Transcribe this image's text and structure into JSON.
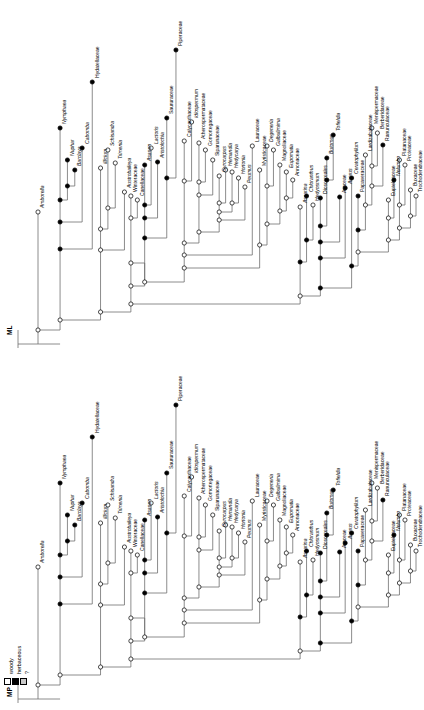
{
  "figure": {
    "kind": "phylogenetic-tree-pair",
    "orientation": "rotated-90",
    "background": "#ffffff",
    "branch_color": "#6f6f6f",
    "node_open_fill": "#ffffff",
    "node_filled_fill": "#000000",
    "node_unknown_fill": "#c9c9c9"
  },
  "legend": {
    "title": "",
    "items": [
      {
        "label": "woody",
        "swatch": "white",
        "color": "#ffffff"
      },
      {
        "label": "herbaceous",
        "swatch": "black",
        "color": "#000000"
      },
      {
        "label": "?",
        "swatch": "gray",
        "color": "#c9c9c9"
      }
    ]
  },
  "trees": [
    {
      "id": "ML",
      "name": "ML",
      "taxa": [
        "Amborella",
        "Nymphaea",
        "Nuphar",
        "Barclaya",
        "Cabomba",
        "Hydatellaceae",
        "Illicium",
        "Schisandra",
        "Trimenia",
        "Austrobaileya",
        "Winteraceae",
        "Canellaceae",
        "Asarum",
        "Lactoris",
        "Aristolochia",
        "Saururaceae",
        "Piperaceae",
        "Calycanthaceae",
        "Idiospermum",
        "Atherospermataceae",
        "Gomortegaceae",
        "Siparunaceae",
        "Gyrocarpus",
        "Hernandia",
        "Hedycarya",
        "Hortonia",
        "Peumus",
        "Lauraceae",
        "Myristicaceae",
        "Degeneria",
        "Galbulimima",
        "Magnoliaceae",
        "Eupomatia",
        "Annonaceae",
        "Ascarina",
        "Chloranthus",
        "Hedyosmum",
        "Dioscoreales",
        "Butomus",
        "Tofieldia",
        "Araceae",
        "Acorus",
        "Ceratophyllum",
        "Papaveraceae",
        "Lardizabalaceae",
        "Menispermaceae",
        "Berberidaceae",
        "Ranunculaceae",
        "Eupteleaceae",
        "Nelumbo",
        "Platanaceae",
        "Proteaceae",
        "Buxaceae",
        "Trochodendraceae"
      ]
    },
    {
      "id": "MP",
      "name": "MP",
      "taxa": [
        "Amborella",
        "Nymphaea",
        "Nuphar",
        "Barclaya",
        "Cabomba",
        "Hydatellaceae",
        "Illicium",
        "Schisandra",
        "Trimenia",
        "Austrobaileya",
        "Winteraceae",
        "Canellaceae",
        "Asarum",
        "Lactoris",
        "Aristolochia",
        "Saururaceae",
        "Piperaceae",
        "Calycanthaceae",
        "Idiospermum",
        "Atherospermataceae",
        "Gomortegaceae",
        "Siparunaceae",
        "Gyrocarpus",
        "Hernandia",
        "Hedycarya",
        "Hortonia",
        "Peumus",
        "Lauraceae",
        "Myristicaceae",
        "Degeneria",
        "Galbulimima",
        "Magnoliaceae",
        "Eupomatia",
        "Annonaceae",
        "Ascarina",
        "Chloranthus",
        "Hedyosmum",
        "Dioscoreales",
        "Butomus",
        "Tofieldia",
        "Araceae",
        "Acorus",
        "Ceratophyllum",
        "Papaveraceae",
        "Lardizabalaceae",
        "Menispermaceae",
        "Berberidaceae",
        "Ranunculaceae",
        "Eupteleaceae",
        "Nelumbo",
        "Platanaceae",
        "Proteaceae",
        "Buxaceae",
        "Trochodendraceae"
      ]
    }
  ],
  "italic_taxa": [
    "Amborella",
    "Nymphaea",
    "Nuphar",
    "Barclaya",
    "Cabomba",
    "Illicium",
    "Schisandra",
    "Trimenia",
    "Austrobaileya",
    "Asarum",
    "Lactoris",
    "Aristolochia",
    "Idiospermum",
    "Gyrocarpus",
    "Hernandia",
    "Hedycarya",
    "Hortonia",
    "Peumus",
    "Degeneria",
    "Galbulimima",
    "Eupomatia",
    "Ascarina",
    "Chloranthus",
    "Hedyosmum",
    "Butomus",
    "Tofieldia",
    "Acorus",
    "Ceratophyllum",
    "Nelumbo"
  ],
  "tip_states": {
    "Amborella": "woody",
    "Nymphaea": "herbaceous",
    "Nuphar": "herbaceous",
    "Barclaya": "herbaceous",
    "Cabomba": "herbaceous",
    "Hydatellaceae": "herbaceous",
    "Illicium": "woody",
    "Schisandra": "woody",
    "Trimenia": "woody",
    "Austrobaileya": "woody",
    "Winteraceae": "woody",
    "Canellaceae": "woody",
    "Asarum": "herbaceous",
    "Lactoris": "woody",
    "Aristolochia": "herbaceous",
    "Saururaceae": "herbaceous",
    "Piperaceae": "herbaceous",
    "Calycanthaceae": "woody",
    "Idiospermum": "woody",
    "Atherospermataceae": "woody",
    "Gomortegaceae": "woody",
    "Siparunaceae": "woody",
    "Gyrocarpus": "woody",
    "Hernandia": "woody",
    "Hedycarya": "woody",
    "Hortonia": "woody",
    "Peumus": "woody",
    "Lauraceae": "woody",
    "Myristicaceae": "woody",
    "Degeneria": "woody",
    "Galbulimima": "woody",
    "Magnoliaceae": "woody",
    "Eupomatia": "woody",
    "Annonaceae": "woody",
    "Ascarina": "woody",
    "Chloranthus": "herbaceous",
    "Hedyosmum": "woody",
    "Dioscoreales": "herbaceous",
    "Butomus": "herbaceous",
    "Tofieldia": "herbaceous",
    "Araceae": "herbaceous",
    "Acorus": "herbaceous",
    "Ceratophyllum": "herbaceous",
    "Papaveraceae": "herbaceous",
    "Lardizabalaceae": "woody",
    "Menispermaceae": "woody",
    "Berberidaceae": "woody",
    "Ranunculaceae": "herbaceous",
    "Eupteleaceae": "woody",
    "Nelumbo": "herbaceous",
    "Platanaceae": "woody",
    "Proteaceae": "woody",
    "Buxaceae": "woody",
    "Trochodendraceae": "woody"
  },
  "chart_data": {
    "type": "tree",
    "title": "",
    "panels": [
      {
        "name": "ML",
        "note": "maximum likelihood reconstruction"
      },
      {
        "name": "MP",
        "note": "maximum parsimony reconstruction"
      }
    ],
    "character": "habit",
    "states": [
      "woody",
      "herbaceous",
      "?"
    ],
    "n_taxa": 54
  }
}
